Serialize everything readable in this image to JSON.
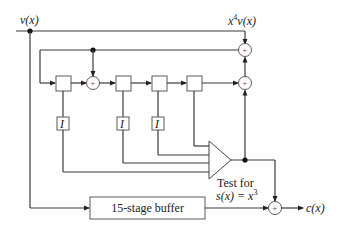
{
  "diagram": {
    "type": "block-diagram",
    "title": "",
    "labels": {
      "input": "v(x)",
      "shifted_output": "x⁴v(x)",
      "shifted_base": "x",
      "shifted_exp": "4",
      "shifted_rest": "v(x)",
      "test_line1": "Test for",
      "test_line2_base": "s(x) = x",
      "test_line2_exp": "3",
      "buffer": "15-stage buffer",
      "output": "c(x)",
      "inverter": "I",
      "adder": "+"
    },
    "nodes": [
      {
        "id": "input",
        "label": "v(x)"
      },
      {
        "id": "reg1",
        "label": ""
      },
      {
        "id": "adder1",
        "label": "+"
      },
      {
        "id": "reg2",
        "label": ""
      },
      {
        "id": "reg3",
        "label": ""
      },
      {
        "id": "reg4",
        "label": ""
      },
      {
        "id": "adder_top",
        "label": "+"
      },
      {
        "id": "adder_mid",
        "label": "+"
      },
      {
        "id": "inv1",
        "label": "I"
      },
      {
        "id": "inv2",
        "label": "I"
      },
      {
        "id": "inv3",
        "label": "I"
      },
      {
        "id": "comparator",
        "label": "Test for s(x) = x^3"
      },
      {
        "id": "buffer",
        "label": "15-stage buffer"
      },
      {
        "id": "adder_out",
        "label": "+"
      },
      {
        "id": "output",
        "label": "c(x)"
      }
    ],
    "edges": [
      {
        "from": "input",
        "to": "adder_top"
      },
      {
        "from": "input",
        "to": "buffer"
      },
      {
        "from": "reg1",
        "to": "adder1"
      },
      {
        "from": "adder1",
        "to": "reg2"
      },
      {
        "from": "reg2",
        "to": "reg3"
      },
      {
        "from": "reg3",
        "to": "reg4"
      },
      {
        "from": "reg4",
        "to": "adder_mid"
      },
      {
        "from": "adder_mid",
        "to": "adder_top"
      },
      {
        "from": "adder_top",
        "to": "feedback_loop"
      },
      {
        "from": "feedback_loop",
        "to": "adder1"
      },
      {
        "from": "feedback_loop",
        "to": "reg1"
      },
      {
        "from": "reg1",
        "to": "inv1"
      },
      {
        "from": "reg2",
        "to": "inv2"
      },
      {
        "from": "reg3",
        "to": "inv3"
      },
      {
        "from": "inv1",
        "to": "comparator"
      },
      {
        "from": "inv2",
        "to": "comparator"
      },
      {
        "from": "inv3",
        "to": "comparator"
      },
      {
        "from": "reg4",
        "to": "comparator"
      },
      {
        "from": "comparator",
        "to": "adder_mid"
      },
      {
        "from": "comparator",
        "to": "adder_out"
      },
      {
        "from": "buffer",
        "to": "adder_out"
      },
      {
        "from": "adder_out",
        "to": "output"
      }
    ]
  }
}
